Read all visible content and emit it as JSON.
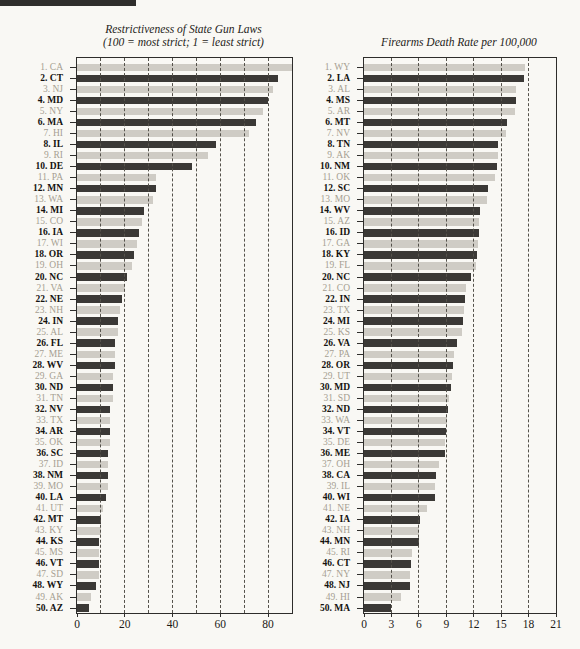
{
  "decor": {
    "top_rule_color": "#2f2e2c"
  },
  "colors": {
    "background": "#f9f8f4",
    "bar_dark": "#3b3936",
    "bar_light": "#cfccc5",
    "label_dark": "#14120f",
    "label_light": "#a69f92",
    "frame": "#2e2d2b",
    "grid": "#55524b"
  },
  "chart_data": [
    {
      "type": "bar",
      "orientation": "horizontal",
      "title": "Restrictiveness of State Gun Laws",
      "subtitle": "(100 = most strict; 1 = least strict)",
      "xlim": [
        0,
        90
      ],
      "xticks": [
        0,
        20,
        40,
        60,
        80
      ],
      "gridlines": [
        10,
        20,
        30,
        40,
        50,
        60,
        70,
        80
      ],
      "grid": "dashed",
      "bar_style_alternation": [
        "light",
        "dark"
      ],
      "categories": [
        "1. CA",
        "2. CT",
        "3. NJ",
        "4. MD",
        "5. NY",
        "6. MA",
        "7. HI",
        "8. IL",
        "9. RI",
        "10. DE",
        "11. PA",
        "12. MN",
        "13. WA",
        "14. MI",
        "15. CO",
        "16. IA",
        "17. WI",
        "18. OR",
        "19. OH",
        "20. NC",
        "21. VA",
        "22. NE",
        "23. NH",
        "24. IN",
        "25. AL",
        "26. FL",
        "27. ME",
        "28. WV",
        "29. GA",
        "30. ND",
        "31. TN",
        "32. NV",
        "33. TX",
        "34. AR",
        "35. OK",
        "36. SC",
        "37. ID",
        "38. NM",
        "39. MO",
        "40. LA",
        "41. UT",
        "42. MT",
        "43. KY",
        "44. KS",
        "45. MS",
        "46. VT",
        "47. SD",
        "48. WY",
        "49. AK",
        "50. AZ"
      ],
      "values": [
        90,
        84,
        82,
        80,
        78,
        75,
        72,
        58,
        55,
        48,
        33,
        33,
        32,
        28,
        27,
        26,
        25,
        24,
        23,
        21,
        20,
        19,
        18,
        17,
        17,
        16,
        16,
        16,
        15,
        15,
        15,
        14,
        14,
        14,
        14,
        13,
        13,
        13,
        13,
        12,
        11,
        10,
        10,
        9,
        9,
        9,
        9,
        8,
        6,
        5
      ]
    },
    {
      "type": "bar",
      "orientation": "horizontal",
      "title": "Firearms Death Rate per 100,000",
      "subtitle": "",
      "xlim": [
        0,
        21
      ],
      "xticks": [
        0,
        3,
        6,
        9,
        12,
        15,
        18,
        21
      ],
      "gridlines": [
        3,
        6,
        9,
        12,
        15,
        18
      ],
      "grid": "dashed",
      "bar_style_alternation": [
        "light",
        "dark"
      ],
      "categories": [
        "1. WY",
        "2. LA",
        "3. AL",
        "4. MS",
        "5. AR",
        "6. MT",
        "7. NV",
        "8. TN",
        "9. AK",
        "10. NM",
        "11. OK",
        "12. SC",
        "13. MO",
        "14. WV",
        "15. AZ",
        "16. ID",
        "17. GA",
        "18. KY",
        "19. FL",
        "20. NC",
        "21. CO",
        "22. IN",
        "23. TX",
        "24. MI",
        "25. KS",
        "26. VA",
        "27. PA",
        "28. OR",
        "29. UT",
        "30. MD",
        "31. SD",
        "32. ND",
        "33. WA",
        "34. VT",
        "35. DE",
        "36. ME",
        "37. OH",
        "38. CA",
        "39. IL",
        "40. WI",
        "41. NE",
        "42. IA",
        "43. NH",
        "44. MN",
        "45. RI",
        "46. CT",
        "47. NY",
        "48. NJ",
        "49. HI",
        "50. MA"
      ],
      "values": [
        17.6,
        17.5,
        16.6,
        16.6,
        16.5,
        15.6,
        15.5,
        14.7,
        14.6,
        14.5,
        14.3,
        13.6,
        13.4,
        12.7,
        12.6,
        12.6,
        12.5,
        12.4,
        12.2,
        11.7,
        11.1,
        11.0,
        10.9,
        10.8,
        10.7,
        10.2,
        9.8,
        9.7,
        9.6,
        9.5,
        9.3,
        9.2,
        9.1,
        9.0,
        8.9,
        8.8,
        8.2,
        7.9,
        7.8,
        7.8,
        6.9,
        6.1,
        6.0,
        6.0,
        5.2,
        5.1,
        5.0,
        5.0,
        4.0,
        3.0
      ]
    }
  ]
}
